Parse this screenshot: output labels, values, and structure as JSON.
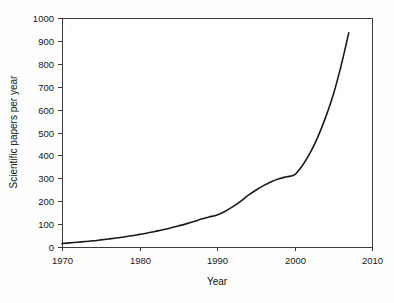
{
  "chart_data": {
    "type": "line",
    "title": "",
    "xlabel": "Year",
    "ylabel": "Scientific papers per year",
    "xlim": [
      1970,
      2010
    ],
    "ylim": [
      0,
      1000
    ],
    "grid": false,
    "legend": "none",
    "xticks": [
      1970,
      1980,
      1990,
      2000,
      2010
    ],
    "xtick_labels": [
      "1970",
      "1980",
      "1990",
      "2000",
      "2010"
    ],
    "yticks": [
      0,
      100,
      200,
      300,
      400,
      500,
      600,
      700,
      800,
      900,
      1000
    ],
    "ytick_labels": [
      "0",
      "100",
      "200",
      "300",
      "400",
      "500",
      "600",
      "700",
      "800",
      "900",
      "1000"
    ],
    "line_color": "#1a1a1a",
    "line_width": 1.6,
    "series": [
      {
        "name": "Scientific papers per year",
        "x": [
          1970,
          1971,
          1972,
          1973,
          1974,
          1975,
          1976,
          1977,
          1978,
          1979,
          1980,
          1981,
          1982,
          1983,
          1984,
          1985,
          1986,
          1987,
          1988,
          1989,
          1990,
          1991,
          1992,
          1993,
          1994,
          1995,
          1996,
          1997,
          1998,
          1999,
          2000,
          2001,
          2002,
          2003,
          2004,
          2005,
          2006,
          2007
        ],
        "values": [
          15,
          18,
          21,
          24,
          27,
          31,
          35,
          39,
          44,
          49,
          55,
          61,
          68,
          75,
          83,
          92,
          101,
          111,
          122,
          131,
          140,
          155,
          175,
          198,
          225,
          248,
          268,
          285,
          298,
          307,
          315,
          355,
          410,
          480,
          565,
          665,
          790,
          935
        ]
      }
    ]
  },
  "axes": {
    "x_title": "Year",
    "y_title": "Scientific papers per year"
  }
}
